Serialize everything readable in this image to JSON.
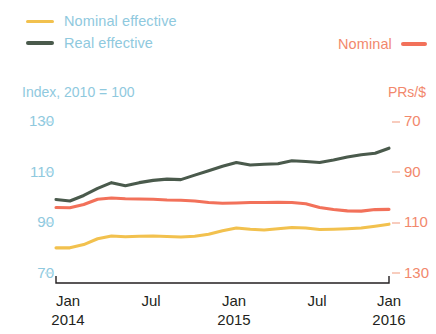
{
  "legend": {
    "nominal_effective": {
      "label": "Nominal effective",
      "color": "#F2C14E"
    },
    "real_effective": {
      "label": "Real effective",
      "color": "#4A5A4C"
    },
    "nominal_prs": {
      "label": "Nominal",
      "color": "#F2715A"
    }
  },
  "axes": {
    "left_caption": "Index, 2010 = 100",
    "right_caption": "PRs/$",
    "left_ticks": [
      "130",
      "110",
      "90",
      "70"
    ],
    "right_ticks": [
      "70",
      "90",
      "110",
      "130"
    ],
    "x_ticks": [
      {
        "month": "Jan",
        "year": "2014"
      },
      {
        "month": "Jul",
        "year": ""
      },
      {
        "month": "Jan",
        "year": "2015"
      },
      {
        "month": "Jul",
        "year": ""
      },
      {
        "month": "Jan",
        "year": "2016"
      }
    ]
  },
  "chart_data": {
    "type": "line",
    "title": "",
    "xlabel": "",
    "ylabel": "Index, 2010 = 100",
    "y2label": "PRs/$",
    "grid": false,
    "legend_position": "top",
    "ylim": [
      70,
      130
    ],
    "y2lim": [
      130,
      70
    ],
    "y2_inverted": true,
    "x": [
      "2014-01",
      "2014-02",
      "2014-03",
      "2014-04",
      "2014-05",
      "2014-06",
      "2014-07",
      "2014-08",
      "2014-09",
      "2014-10",
      "2014-11",
      "2014-12",
      "2015-01",
      "2015-02",
      "2015-03",
      "2015-04",
      "2015-05",
      "2015-06",
      "2015-07",
      "2015-08",
      "2015-09",
      "2015-10",
      "2015-11",
      "2015-12",
      "2016-01"
    ],
    "series": [
      {
        "name": "Real effective",
        "color": "#4A5A4C",
        "axis": "left",
        "unit": "Index, 2010 = 100",
        "values": [
          99.2,
          98.6,
          100.8,
          103.6,
          105.9,
          104.7,
          105.9,
          106.8,
          107.3,
          107.1,
          108.9,
          110.6,
          112.4,
          113.9,
          112.9,
          113.2,
          113.4,
          114.6,
          114.3,
          113.9,
          114.9,
          116.1,
          117.0,
          117.6,
          119.6
        ]
      },
      {
        "name": "Nominal effective",
        "color": "#F2C14E",
        "axis": "left",
        "unit": "Index, 2010 = 100",
        "values": [
          80.0,
          80.0,
          81.3,
          83.6,
          84.7,
          84.4,
          84.6,
          84.7,
          84.5,
          84.3,
          84.6,
          85.4,
          86.8,
          87.9,
          87.4,
          87.1,
          87.6,
          88.1,
          87.9,
          87.3,
          87.4,
          87.6,
          87.9,
          88.6,
          89.4
        ]
      },
      {
        "name": "Nominal",
        "color": "#F2715A",
        "axis": "right",
        "unit": "PRs/$",
        "values": [
          104.0,
          104.1,
          102.8,
          100.7,
          100.2,
          100.5,
          100.6,
          100.7,
          101.0,
          101.1,
          101.4,
          102.0,
          102.3,
          102.2,
          102.0,
          102.0,
          101.9,
          102.0,
          102.5,
          104.0,
          104.8,
          105.3,
          105.4,
          104.8,
          104.7
        ]
      }
    ]
  }
}
